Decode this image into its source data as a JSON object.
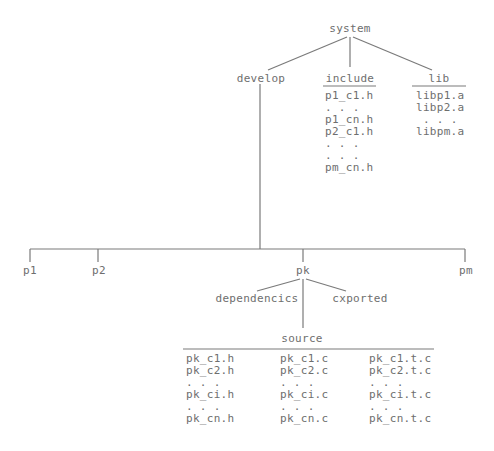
{
  "diagram": {
    "type": "directory-tree",
    "root": {
      "label": "system",
      "children": [
        {
          "label": "develop",
          "children": [
            {
              "label": "p1"
            },
            {
              "label": "p2"
            },
            {
              "label": "pk",
              "children": [
                {
                  "label": "dependencics"
                },
                {
                  "label": "cxported"
                },
                {
                  "label": "source",
                  "columns": [
                    [
                      "pk_c1.h",
                      "pk_c2.h",
                      ". . .",
                      "pk_ci.h",
                      ". . .",
                      "pk_cn.h"
                    ],
                    [
                      "pk_c1.c",
                      "pk_c2.c",
                      ". . .",
                      "pk_ci.c",
                      ". . .",
                      "pk_cn.c"
                    ],
                    [
                      "pk_c1.t.c",
                      "pk_c2.t.c",
                      ". . .",
                      "pk_ci.t.c",
                      ". . .",
                      "pk_cn.t.c"
                    ]
                  ]
                }
              ]
            },
            {
              "label": "pm"
            }
          ]
        },
        {
          "label": "include",
          "files": [
            "p1_c1.h",
            ". . .",
            "p1_cn.h",
            "p2_c1.h",
            ". . .",
            ". . .",
            "pm_cn.h"
          ]
        },
        {
          "label": "lib",
          "files": [
            "libp1.a",
            "libp2.a",
            ". . .",
            "libpm.a"
          ]
        }
      ]
    }
  }
}
